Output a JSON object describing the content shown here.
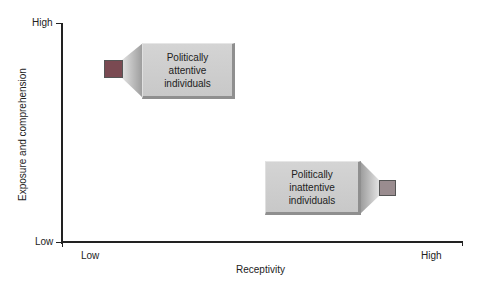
{
  "diagram": {
    "type": "quadrant-callout",
    "y_axis": {
      "title": "Exposure and comprehension",
      "high_label": "High",
      "low_label": "Low"
    },
    "x_axis": {
      "title": "Receptivity",
      "low_label": "Low",
      "high_label": "High"
    },
    "callouts": [
      {
        "label": "Politically attentive individuals",
        "lines": [
          "Politically",
          "attentive",
          "individuals"
        ],
        "position": "high exposure, low receptivity",
        "marker_color": "#7a4a52"
      },
      {
        "label": "Politically inattentive individuals",
        "lines": [
          "Politically",
          "inattentive",
          "individuals"
        ],
        "position": "low exposure, high receptivity",
        "marker_color": "#9a8c8f"
      }
    ],
    "colors": {
      "box": "#cccccc",
      "box_shadow": "#8f8f8f",
      "axis": "#222222"
    }
  }
}
